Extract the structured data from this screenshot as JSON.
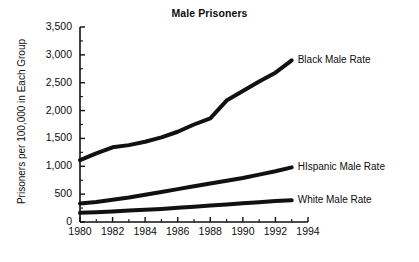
{
  "chart_data": {
    "type": "line",
    "title": "Male Prisoners",
    "xlabel": "",
    "ylabel": "Prisoners  per 100,000 in Each Group",
    "xlim": [
      1980,
      1994
    ],
    "ylim": [
      0,
      3500
    ],
    "grid": false,
    "legend_position": "right-inline-labels",
    "x_tick_labels": [
      "1980",
      "1982",
      "1984",
      "1986",
      "1988",
      "1990",
      "1992",
      "1994"
    ],
    "x_tick_values": [
      1980,
      1982,
      1984,
      1986,
      1988,
      1990,
      1992,
      1994
    ],
    "x_minor_tick_values": [
      1981,
      1983,
      1985,
      1987,
      1989,
      1991,
      1993
    ],
    "y_tick_labels": [
      "0",
      "500",
      "1,000",
      "1,500",
      "2,000",
      "2,500",
      "3,000",
      "3,500"
    ],
    "y_tick_values": [
      0,
      500,
      1000,
      1500,
      2000,
      2500,
      3000,
      3500
    ],
    "x": [
      1980,
      1981,
      1982,
      1983,
      1984,
      1985,
      1986,
      1987,
      1988,
      1989,
      1990,
      1991,
      1992,
      1993
    ],
    "series": [
      {
        "name": "Black Male Rate",
        "label": "Black Male Rate",
        "color": "#111111",
        "values": [
          1110,
          1230,
          1340,
          1380,
          1440,
          1520,
          1620,
          1750,
          1860,
          2180,
          2350,
          2520,
          2680,
          2900
        ]
      },
      {
        "name": "HIspanic Male Rate",
        "label": "HIspanic Male Rate",
        "color": "#111111",
        "values": [
          330,
          360,
          400,
          440,
          490,
          540,
          590,
          640,
          690,
          740,
          790,
          850,
          910,
          980
        ]
      },
      {
        "name": "White Male Rate",
        "label": "White Male Rate",
        "color": "#111111",
        "values": [
          165,
          175,
          190,
          205,
          220,
          235,
          255,
          275,
          295,
          315,
          335,
          355,
          375,
          390
        ]
      }
    ],
    "annotations": []
  },
  "style": {
    "axis_color": "#111111",
    "line_color": "#111111",
    "background": "#ffffff",
    "line_width": 4
  }
}
